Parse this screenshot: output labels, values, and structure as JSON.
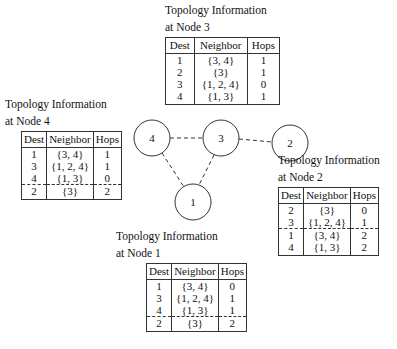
{
  "graph": {
    "nodes": [
      {
        "id": "4",
        "label": "4",
        "x": 152,
        "y": 138
      },
      {
        "id": "3",
        "label": "3",
        "x": 221,
        "y": 138
      },
      {
        "id": "2",
        "label": "2",
        "x": 290,
        "y": 143
      },
      {
        "id": "1",
        "label": "1",
        "x": 193,
        "y": 202
      }
    ],
    "edges": [
      [
        "4",
        "3"
      ],
      [
        "3",
        "2"
      ],
      [
        "4",
        "1"
      ],
      [
        "3",
        "1"
      ]
    ],
    "edge_style": "dashed"
  },
  "tables": {
    "node3": {
      "caption_line1": "Topology Information",
      "caption_line2": "at Node 3",
      "headers": [
        "Dest",
        "Neighbor",
        "Hops"
      ],
      "rows": [
        {
          "dest": "1",
          "neighbor": "{3, 4}",
          "hops": "1"
        },
        {
          "dest": "2",
          "neighbor": "{3}",
          "hops": "1"
        },
        {
          "dest": "3",
          "neighbor": "{1, 2, 4}",
          "hops": "0"
        },
        {
          "dest": "4",
          "neighbor": "{1, 3}",
          "hops": "1"
        }
      ]
    },
    "node4": {
      "caption_line1": "Topology Information",
      "caption_line2": "at Node 4",
      "headers": [
        "Dest",
        "Neighbor",
        "Hops"
      ],
      "rows": [
        {
          "dest": "1",
          "neighbor": "{3, 4}",
          "hops": "1"
        },
        {
          "dest": "3",
          "neighbor": "{1, 2, 4}",
          "hops": "1"
        },
        {
          "dest": "4",
          "neighbor": "{1, 3}",
          "hops": "0"
        },
        {
          "dest": "2",
          "neighbor": "{3}",
          "hops": "2"
        }
      ],
      "dashed_before_row": 3
    },
    "node2": {
      "caption_line1": "Topology Information",
      "caption_line2": "at Node 2",
      "headers": [
        "Dest",
        "Neighbor",
        "Hops"
      ],
      "rows": [
        {
          "dest": "2",
          "neighbor": "{3}",
          "hops": "0"
        },
        {
          "dest": "3",
          "neighbor": "{1, 2, 4}",
          "hops": "1"
        },
        {
          "dest": "1",
          "neighbor": "{3, 4}",
          "hops": "2"
        },
        {
          "dest": "4",
          "neighbor": "{1, 3}",
          "hops": "2"
        }
      ],
      "dashed_before_row": 2
    },
    "node1": {
      "caption_line1": "Topology Information",
      "caption_line2": "at Node 1",
      "headers": [
        "Dest",
        "Neighbor",
        "Hops"
      ],
      "rows": [
        {
          "dest": "1",
          "neighbor": "{3, 4}",
          "hops": "0"
        },
        {
          "dest": "3",
          "neighbor": "{1, 2, 4}",
          "hops": "1"
        },
        {
          "dest": "4",
          "neighbor": "{1, 3}",
          "hops": "1"
        },
        {
          "dest": "2",
          "neighbor": "{3}",
          "hops": "2"
        }
      ],
      "dashed_before_row": 3
    }
  }
}
